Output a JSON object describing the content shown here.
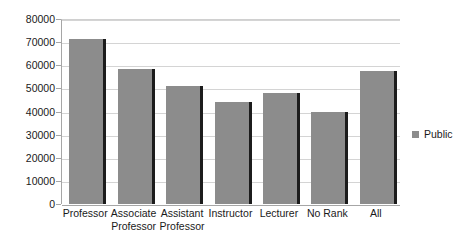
{
  "chart_data": {
    "type": "bar",
    "title": "",
    "subtitle": "",
    "xlabel": "",
    "ylabel": "",
    "categories": [
      "Professor",
      "Associate Professor",
      "Assistant Professor",
      "Instructor",
      "Lecturer",
      "No Rank",
      "All"
    ],
    "category_labels": [
      "Professor",
      "Associate\nProfessor",
      "Assistant\nProfessor",
      "Instructor",
      "Lecturer",
      "No Rank",
      "All"
    ],
    "series": [
      {
        "name": "Public",
        "color": "#8c8c8c",
        "values": [
          71500,
          58500,
          51000,
          44000,
          48000,
          40000,
          57500
        ]
      }
    ],
    "ylim": [
      0,
      80000
    ],
    "ytick_values": [
      0,
      10000,
      20000,
      30000,
      40000,
      50000,
      60000,
      70000,
      80000
    ],
    "ytick_labels": [
      "0",
      "10000",
      "20000",
      "30000",
      "40000",
      "50000",
      "60000",
      "70000",
      "80000"
    ],
    "grid": true,
    "grid_axis": "y",
    "legend": {
      "position": "right",
      "entries": [
        {
          "label": "Public",
          "color": "#8c8c8c",
          "marker": "square-swatch"
        }
      ]
    },
    "colors": {
      "bar_fill": "#8c8c8c",
      "bar_edge": "#1c1c1c",
      "gridline": "#d4d4d4",
      "axis": "#a6a6a6",
      "text": "#1a1a1a",
      "background": "#ffffff"
    }
  }
}
